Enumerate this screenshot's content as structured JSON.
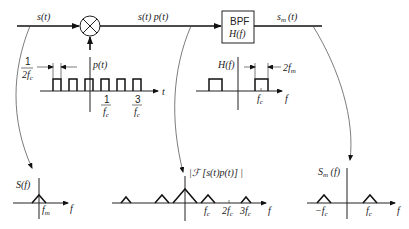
{
  "block_diagram": {
    "input_signal": "s(t)",
    "mixer_symbol": "multiplier",
    "mixer_input": "p(t)",
    "product_signal": "s(t) p(t)",
    "filter": {
      "line1": "BPF",
      "line2": "H(f)"
    },
    "output_signal": "s",
    "output_sub": "m",
    "output_arg": "(t)"
  },
  "pulse_train": {
    "label": "p(t)",
    "width_annotation_num": "1",
    "width_annotation_den": "2f",
    "width_annotation_den_sub": "c",
    "tick1_num": "1",
    "tick1_den": "f",
    "tick1_den_sub": "c",
    "tick2_num": "3",
    "tick2_den": "f",
    "tick2_den_sub": "c",
    "axis_label": "t"
  },
  "filter_response": {
    "label": "H(f)",
    "bandwidth_annotation": "2f",
    "bandwidth_sub": "m",
    "center_label": "f",
    "center_sub": "c",
    "axis_label": "f"
  },
  "spectrum_input": {
    "label": "S(f)",
    "tick_label": "f",
    "tick_sub": "m",
    "axis_label": "f"
  },
  "spectrum_product": {
    "label": "|ℱ  [s(t)p(t)] |",
    "ticks": [
      {
        "pre": "",
        "base": "f",
        "sub": "c"
      },
      {
        "pre": "2",
        "base": "f",
        "sub": "c"
      },
      {
        "pre": "3",
        "base": "f",
        "sub": "c"
      }
    ],
    "axis_label": "f"
  },
  "spectrum_output": {
    "label": "S",
    "label_sub": "m",
    "label_arg": " (f)",
    "neg_tick": "−f",
    "neg_tick_sub": "c",
    "pos_tick": "f",
    "pos_tick_sub": "c",
    "axis_label": "f"
  },
  "colors": {
    "ink": "#222222",
    "background": "#ffffff"
  }
}
